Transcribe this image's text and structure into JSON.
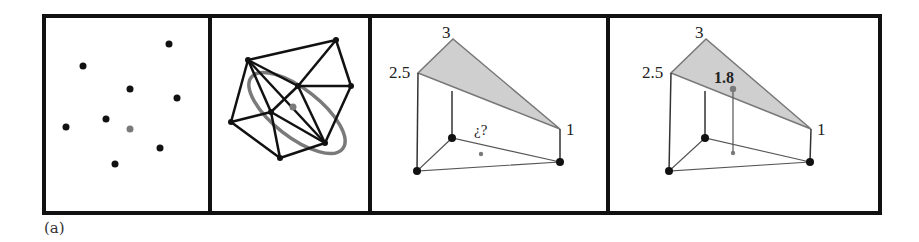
{
  "figure": {
    "caption": "(a)",
    "colors": {
      "ink": "#111111",
      "highlight": "#7a7a7a",
      "fill": "#cfcfcf",
      "background": "#ffffff"
    },
    "frame": {
      "x": 44,
      "y": 16,
      "width": 836,
      "height": 197,
      "dividers_x": [
        210,
        370,
        608
      ]
    },
    "panels": [
      {
        "id": "scattered-points",
        "points": [
          [
            169,
            44
          ],
          [
            83,
            66
          ],
          [
            130,
            89
          ],
          [
            177,
            98
          ],
          [
            106,
            119
          ],
          [
            66,
            127
          ],
          [
            160,
            148
          ],
          [
            115,
            164
          ]
        ],
        "query_point": [
          130,
          129
        ]
      },
      {
        "id": "delaunay-triangulation",
        "vertices": {
          "A": [
            248,
            60
          ],
          "B": [
            336,
            40
          ],
          "C": [
            351,
            86
          ],
          "D": [
            231,
            122
          ],
          "E": [
            280,
            158
          ],
          "F": [
            325,
            143
          ],
          "G": [
            298,
            86
          ],
          "H": [
            271,
            112
          ]
        },
        "edges": [
          [
            "A",
            "B"
          ],
          [
            "B",
            "C"
          ],
          [
            "C",
            "F"
          ],
          [
            "F",
            "E"
          ],
          [
            "E",
            "D"
          ],
          [
            "D",
            "A"
          ],
          [
            "A",
            "G"
          ],
          [
            "B",
            "G"
          ],
          [
            "G",
            "C"
          ],
          [
            "A",
            "H"
          ],
          [
            "D",
            "H"
          ],
          [
            "H",
            "E"
          ],
          [
            "H",
            "G"
          ],
          [
            "G",
            "F"
          ],
          [
            "H",
            "F"
          ],
          [
            "A",
            "F"
          ]
        ],
        "ellipse": {
          "cx": 297,
          "cy": 113,
          "rx": 58,
          "ry": 24,
          "rotate": 38
        },
        "query_point": [
          293,
          107
        ]
      },
      {
        "id": "linear-interpolation-unknown",
        "labels": {
          "top": "3",
          "left": "2.5",
          "right": "1",
          "query": "¿?"
        },
        "top_vertices": {
          "top": [
            453,
            39
          ],
          "left": [
            418,
            73
          ],
          "right": [
            560,
            129
          ]
        },
        "base_vertices": {
          "back": [
            452,
            138
          ],
          "front": [
            417,
            171
          ],
          "right": [
            560,
            162
          ]
        },
        "query_point": [
          481,
          154
        ]
      },
      {
        "id": "linear-interpolation-result",
        "labels": {
          "top": "3",
          "left": "2.5",
          "right": "1",
          "value": "1.8"
        },
        "top_vertices": {
          "top": [
            706,
            39
          ],
          "left": [
            671,
            73
          ],
          "right": [
            811,
            129
          ]
        },
        "base_vertices": {
          "back": [
            705,
            138
          ],
          "front": [
            669,
            171
          ],
          "right": [
            810,
            162
          ]
        },
        "query_point_top": [
          733,
          89
        ],
        "query_point_base": [
          733,
          153
        ]
      }
    ]
  }
}
